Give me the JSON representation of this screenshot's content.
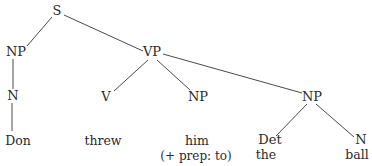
{
  "diagram": {
    "type": "syntax-tree",
    "nodes": {
      "s": "S",
      "np_subject": "NP",
      "vp": "VP",
      "n_subject": "N",
      "v": "V",
      "np_indirect": "NP",
      "np_object": "NP",
      "det": "Det",
      "n_object": "N"
    },
    "words": {
      "don": "Don",
      "threw": "threw",
      "him": "him",
      "him_note": "(+ prep: to)",
      "the": "the",
      "ball": "ball"
    },
    "edges": [
      [
        "S",
        "NP"
      ],
      [
        "S",
        "VP"
      ],
      [
        "NP",
        "N"
      ],
      [
        "N",
        "Don"
      ],
      [
        "VP",
        "V"
      ],
      [
        "VP",
        "NP (him)"
      ],
      [
        "VP",
        "NP (the ball)"
      ],
      [
        "NP (the ball)",
        "Det"
      ],
      [
        "NP (the ball)",
        "N (ball)"
      ]
    ],
    "line_color": "#4a4a4a",
    "text_color": "#2a2a2a"
  }
}
